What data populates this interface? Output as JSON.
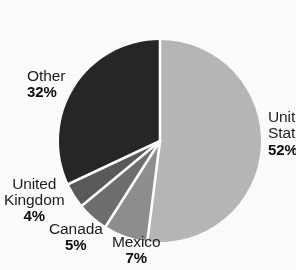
{
  "chart_data": {
    "type": "pie",
    "title": "",
    "subtitle": "",
    "xlabel": "",
    "ylabel": "",
    "legend_position": "none",
    "grid": false,
    "value_unit": "%",
    "start_angle_deg": 0,
    "direction": "clockwise",
    "categories": [
      "United States",
      "Mexico",
      "Canada",
      "United Kingdom",
      "Other"
    ],
    "values": [
      52,
      7,
      5,
      4,
      32
    ],
    "labels": [
      "52%",
      "7%",
      "5%",
      "4%",
      "32%"
    ],
    "colors": [
      "#b7b7b7",
      "#8f8f8f",
      "#6e6e6e",
      "#5a5a5a",
      "#262626"
    ],
    "slices": [
      {
        "name": "United States",
        "value": 52,
        "label": "52%",
        "color": "#b7b7b7",
        "name_line_1": "Unite",
        "name_line_2": "State",
        "clipped": true
      },
      {
        "name": "Mexico",
        "value": 7,
        "label": "7%",
        "color": "#8f8f8f",
        "name_line_1": "Mexico",
        "name_line_2": "",
        "clipped": false
      },
      {
        "name": "Canada",
        "value": 5,
        "label": "5%",
        "color": "#6e6e6e",
        "name_line_1": "Canada",
        "name_line_2": "",
        "clipped": false
      },
      {
        "name": "United Kingdom",
        "value": 4,
        "label": "4%",
        "color": "#5a5a5a",
        "name_line_1": "United",
        "name_line_2": "Kingdom",
        "clipped": false
      },
      {
        "name": "Other",
        "value": 32,
        "label": "32%",
        "color": "#262626",
        "name_line_1": "Other",
        "name_line_2": "",
        "clipped": false
      }
    ]
  },
  "geometry": {
    "center_x": 160,
    "center_y": 141,
    "radius": 101,
    "separator_color": "#ffffff",
    "separator_width": 2.6,
    "background": "#fdfdfd"
  }
}
